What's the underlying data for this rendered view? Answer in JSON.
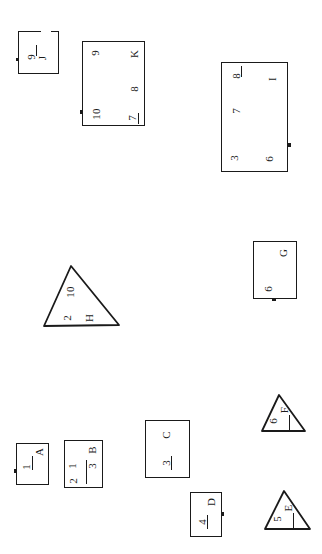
{
  "document": {
    "title": "Hand-drawn geometric shapes worksheet",
    "background_color": "#ffffff",
    "ink_color": "#1a1a1a",
    "width": 322,
    "height": 554
  },
  "shapes": [
    {
      "id": "shape-9-j",
      "kind": "rectangle",
      "labels": [
        "9",
        "J"
      ],
      "label_9": "9",
      "label_j": "J"
    },
    {
      "id": "shape-k",
      "kind": "rectangle",
      "labels": [
        "9",
        "K",
        "8",
        "10",
        "7"
      ],
      "label_9": "9",
      "label_k": "K",
      "label_8": "8",
      "label_10": "10",
      "label_7": "7"
    },
    {
      "id": "shape-i",
      "kind": "rectangle",
      "labels": [
        "8",
        "I",
        "7",
        "3",
        "6"
      ],
      "label_8": "8",
      "label_i": "I",
      "label_7": "7",
      "label_3": "3",
      "label_6": "6"
    },
    {
      "id": "shape-g",
      "kind": "rectangle",
      "labels": [
        "G",
        "6"
      ],
      "label_g": "G",
      "label_6": "6"
    },
    {
      "id": "shape-h",
      "kind": "triangle",
      "labels": [
        "10",
        "2",
        "H"
      ],
      "label_10": "10",
      "label_2": "2",
      "label_h": "H"
    },
    {
      "id": "shape-a",
      "kind": "rectangle",
      "labels": [
        "A",
        "1"
      ],
      "label_a": "A",
      "label_1": "1"
    },
    {
      "id": "shape-b",
      "kind": "rectangle",
      "labels": [
        "B",
        "1",
        "3",
        "2"
      ],
      "label_b": "B",
      "label_1": "1",
      "label_3": "3",
      "label_2": "2"
    },
    {
      "id": "shape-c",
      "kind": "rectangle",
      "labels": [
        "C",
        "3"
      ],
      "label_c": "C",
      "label_3": "3"
    },
    {
      "id": "shape-d",
      "kind": "rectangle",
      "labels": [
        "D",
        "4"
      ],
      "label_d": "D",
      "label_4": "4"
    },
    {
      "id": "shape-f",
      "kind": "triangle",
      "labels": [
        "F",
        "6"
      ],
      "label_f": "F",
      "label_6": "6"
    },
    {
      "id": "shape-e",
      "kind": "triangle",
      "labels": [
        "E",
        "5"
      ],
      "label_e": "E",
      "label_5": "5"
    }
  ]
}
